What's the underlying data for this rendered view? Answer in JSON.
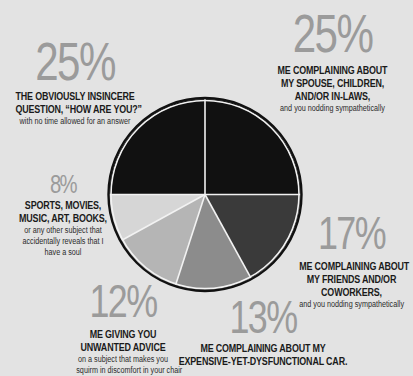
{
  "chart_data": {
    "type": "pie",
    "title": "",
    "start_angle_deg": 0,
    "direction": "clockwise-from-3-oclock",
    "slices": [
      {
        "id": "friends",
        "value": 17,
        "percent_label": "17%",
        "heading": "ME COMPLAINING ABOUT MY FRIENDS AND/OR COWORKERS,",
        "subtext": "and you nodding sympathetically",
        "color": "#3a3a3a"
      },
      {
        "id": "car",
        "value": 13,
        "percent_label": "13%",
        "heading": "ME COMPLAINING ABOUT MY EXPENSIVE-YET-DYSFUNCTIONAL CAR.",
        "subtext": "",
        "color": "#8c8c8c"
      },
      {
        "id": "advice",
        "value": 12,
        "percent_label": "12%",
        "heading": "ME GIVING YOU UNWANTED ADVICE",
        "subtext": "on a subject that makes you squirm in discomfort in your chair",
        "color": "#b5b5b5"
      },
      {
        "id": "sports",
        "value": 8,
        "percent_label": "8%",
        "heading": "SPORTS, MOVIES, MUSIC, ART, BOOKS,",
        "subtext": "or any other subject that accidentally reveals that I have a soul",
        "color": "#d6d6d6"
      },
      {
        "id": "howareyou",
        "value": 25,
        "percent_label": "25%",
        "heading": "THE OBVIOUSLY INSINCERE QUESTION, “HOW ARE YOU?”",
        "subtext": "with no time allowed for an answer",
        "color": "#111111"
      },
      {
        "id": "spouse",
        "value": 25,
        "percent_label": "25%",
        "heading": "ME COMPLAINING ABOUT MY SPOUSE, CHILDREN, AND/OR IN-LAWS,",
        "subtext": "and you nodding sympathetically",
        "color": "#111111"
      }
    ],
    "legend": "inline labels around pie"
  },
  "colors": {
    "background": "#e3e3e3",
    "percent_text": "#9b9b9b",
    "separator": "#f2f2f2",
    "outline": "#111111"
  },
  "labels": {
    "howareyou": {
      "pct": "25%",
      "lines": [
        "THE OBVIOUSLY INSINCERE",
        "QUESTION, “HOW ARE YOU?”"
      ],
      "sub": [
        "with no time allowed for an answer"
      ]
    },
    "spouse": {
      "pct": "25%",
      "lines": [
        "ME COMPLAINING ABOUT",
        "MY SPOUSE, CHILDREN,",
        "AND/OR IN-LAWS,"
      ],
      "sub": [
        "and you nodding sympathetically"
      ]
    },
    "sports": {
      "pct": "8%",
      "lines": [
        "SPORTS, MOVIES,",
        "MUSIC, ART, BOOKS,"
      ],
      "sub": [
        "or any other subject that",
        "accidentally reveals that I",
        "have a soul"
      ]
    },
    "friends": {
      "pct": "17%",
      "lines": [
        "ME COMPLAINING ABOUT",
        "MY FRIENDS AND/OR",
        "COWORKERS,"
      ],
      "sub": [
        "and you nodding sympathetically"
      ]
    },
    "advice": {
      "pct": "12%",
      "lines": [
        "ME GIVING YOU",
        "UNWANTED ADVICE"
      ],
      "sub": [
        "on a subject that makes you",
        "squirm in discomfort in your chair"
      ]
    },
    "car": {
      "pct": "13%",
      "lines": [
        "ME COMPLAINING ABOUT MY",
        "EXPENSIVE-YET-DYSFUNCTIONAL CAR."
      ],
      "sub": []
    }
  }
}
